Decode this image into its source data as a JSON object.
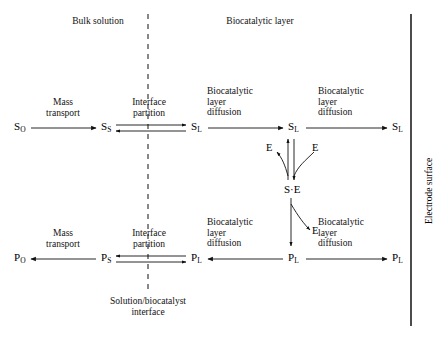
{
  "regions": {
    "bulk_solution": "Bulk solution",
    "biocatalytic_layer": "Biocatalytic layer",
    "electrode_surface": "Electrode surface",
    "interface_caption": "Solution/biocatalyst\ninterface"
  },
  "process_labels": {
    "mass_transport": "Mass\ntransport",
    "interface_partition": "Interface\npartition",
    "layer_diffusion": "Biocatalytic\nlayer\ndiffusion"
  },
  "species": {
    "substrate_bulk": {
      "symbol": "S",
      "sub": "O"
    },
    "substrate_surface": {
      "symbol": "S",
      "sub": "S"
    },
    "substrate_layer": {
      "symbol": "S",
      "sub": "L"
    },
    "product_bulk": {
      "symbol": "P",
      "sub": "O"
    },
    "product_surface": {
      "symbol": "P",
      "sub": "S"
    },
    "product_layer": {
      "symbol": "P",
      "sub": "L"
    },
    "complex": "S·E",
    "enzyme": "E"
  },
  "top_row": {
    "nodes": [
      "S_O",
      "S_S",
      "S_L",
      "S_L",
      "S_L"
    ],
    "steps": [
      "Mass transport",
      "Interface partition",
      "Biocatalytic layer diffusion",
      "Biocatalytic layer diffusion"
    ],
    "directions": [
      "right",
      "equilibrium",
      "right",
      "right"
    ]
  },
  "bottom_row": {
    "nodes": [
      "P_O",
      "P_S",
      "P_L",
      "P_L",
      "P_L"
    ],
    "steps": [
      "Mass transport",
      "Interface partition",
      "Biocatalytic layer diffusion",
      "Biocatalytic layer diffusion"
    ],
    "directions": [
      "left",
      "equilibrium",
      "left",
      "right"
    ]
  },
  "reaction": {
    "binding_label": "E",
    "release_label": "E",
    "product_release_label": "E",
    "complex_label": "S·E"
  },
  "colors": {
    "ink": "#000000",
    "line": "#1a1a1a"
  }
}
